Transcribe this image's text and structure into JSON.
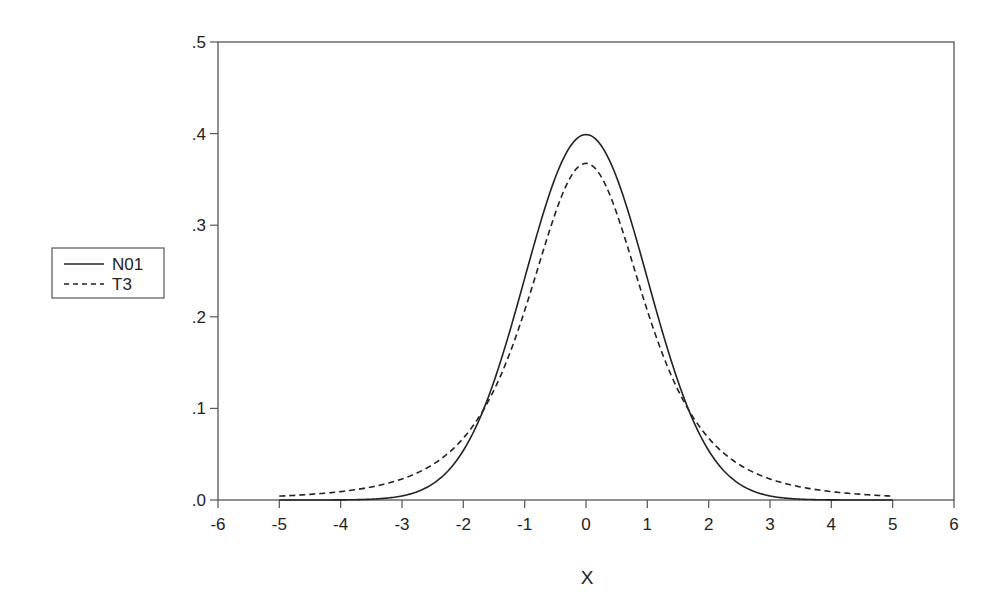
{
  "chart_data": {
    "type": "line",
    "title": "",
    "xlabel": "X",
    "ylabel": "",
    "xlim": [
      -6,
      6
    ],
    "ylim": [
      0,
      0.5
    ],
    "x_ticks": [
      -6,
      -5,
      -4,
      -3,
      -2,
      -1,
      0,
      1,
      2,
      3,
      4,
      5,
      6
    ],
    "x_tick_labels": [
      "-6",
      "-5",
      "-4",
      "-3",
      "-2",
      "-1",
      "0",
      "1",
      "2",
      "3",
      "4",
      "5",
      "6"
    ],
    "y_ticks": [
      0,
      0.1,
      0.2,
      0.3,
      0.4,
      0.5
    ],
    "y_tick_labels": [
      ".0",
      ".1",
      ".2",
      ".3",
      ".4",
      ".5"
    ],
    "grid": false,
    "legend_position": "left-outside",
    "x": [
      -5,
      -4.5,
      -4,
      -3.5,
      -3,
      -2.5,
      -2,
      -1.5,
      -1,
      -0.5,
      0,
      0.5,
      1,
      1.5,
      2,
      2.5,
      3,
      3.5,
      4,
      4.5,
      5
    ],
    "series": [
      {
        "name": "N01",
        "style": "solid",
        "values": [
          0.0,
          0.0,
          0.0001,
          0.0009,
          0.0044,
          0.0175,
          0.054,
          0.1295,
          0.242,
          0.3521,
          0.3989,
          0.3521,
          0.242,
          0.1295,
          0.054,
          0.0175,
          0.0044,
          0.0009,
          0.0001,
          0.0,
          0.0
        ]
      },
      {
        "name": "T3",
        "style": "dashed",
        "values": [
          0.0042,
          0.0057,
          0.0081,
          0.0119,
          0.023,
          0.0376,
          0.0675,
          0.1276,
          0.2067,
          0.3007,
          0.3676,
          0.3007,
          0.2067,
          0.1276,
          0.0675,
          0.0376,
          0.023,
          0.0119,
          0.0081,
          0.0057,
          0.0042
        ]
      }
    ]
  },
  "legend": {
    "items": [
      {
        "label": "N01",
        "style": "solid"
      },
      {
        "label": "T3",
        "style": "dashed"
      }
    ]
  },
  "axes": {
    "x_title": "X",
    "line_color": "#333333",
    "series_color": "#222222"
  }
}
